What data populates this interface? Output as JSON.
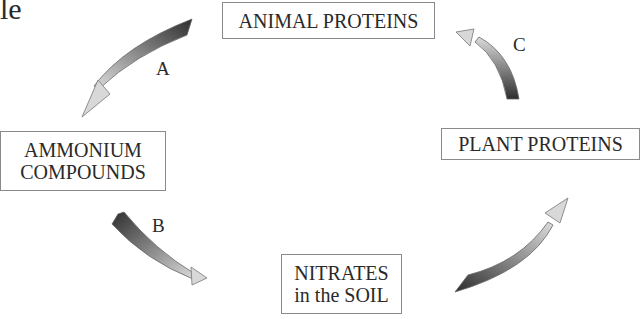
{
  "fragment": "le",
  "nodes": {
    "animal": {
      "line1": "ANIMAL PROTEINS"
    },
    "ammonium": {
      "line1": "AMMONIUM",
      "line2": "COMPOUNDS"
    },
    "plant": {
      "line1": "PLANT PROTEINS"
    },
    "nitrates": {
      "line1": "NITRATES",
      "line2": "in the SOIL"
    }
  },
  "arrows": {
    "a": {
      "label": "A",
      "from": "ANIMAL PROTEINS",
      "to": "AMMONIUM COMPOUNDS"
    },
    "b": {
      "label": "B",
      "from": "AMMONIUM COMPOUNDS",
      "to": "NITRATES in the SOIL"
    },
    "c": {
      "label": "C",
      "from": "PLANT PROTEINS",
      "to": "ANIMAL PROTEINS"
    },
    "d": {
      "label": "",
      "from": "NITRATES in the SOIL",
      "to": "PLANT PROTEINS"
    }
  },
  "colors": {
    "arrow_dark": "#333333",
    "arrow_light": "#d8d8d8",
    "box_border": "#8a8a8a"
  }
}
